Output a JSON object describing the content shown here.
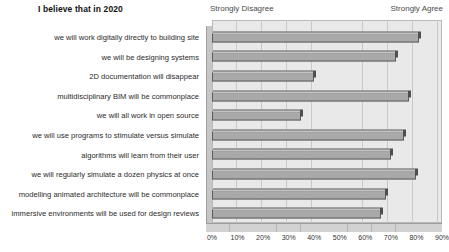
{
  "header": {
    "title": "I believe that in 2020",
    "left_anchor": "Strongly Disagree",
    "right_anchor": "Strongly Agree"
  },
  "chart_data": {
    "type": "bar",
    "orientation": "horizontal",
    "title": "I believe that in 2020",
    "xlabel": "",
    "ylabel": "",
    "xlim": [
      0,
      90
    ],
    "grid": true,
    "legend": false,
    "axis_anchor_low": "Strongly Disagree",
    "axis_anchor_high": "Strongly Agree",
    "tick_labels": [
      "0%",
      "10%",
      "20%",
      "30%",
      "40%",
      "50%",
      "60%",
      "70%",
      "80%",
      "90%"
    ],
    "tick_values": [
      0,
      10,
      20,
      30,
      40,
      50,
      60,
      70,
      80,
      90
    ],
    "categories": [
      "we will work digitally directly to building site",
      "we will be designing systems",
      "2D documentation will disappear",
      "multidisciplinary BIM will be commonplace",
      "we will all work in open source",
      "we will use programs to stimulate versus simulate",
      "algorithms will learn from their user",
      "we will regularly simulate a dozen physics at once",
      "modelling animated architecture will be commonplace",
      "immersive environments will be used for design reviews"
    ],
    "values": [
      81,
      72,
      40,
      77,
      35,
      75,
      70,
      80,
      68,
      66
    ],
    "bar_color": "#a9a9a9",
    "plot_background": "#e9e9e9"
  }
}
